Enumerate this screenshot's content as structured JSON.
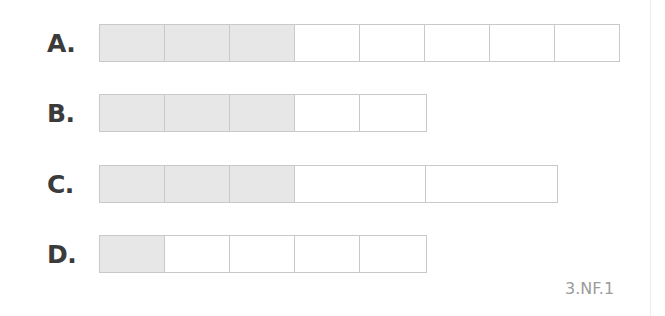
{
  "diagram": {
    "type": "fraction-bar-models",
    "shaded_color": "#e7e7e7",
    "border_color": "#c9c9c9",
    "label_color": "#3b3b3b",
    "rows": [
      {
        "label": "A.",
        "total_parts": 8,
        "shaded_parts": 3,
        "fraction": "3/8",
        "cell_widths": [
          65,
          65,
          65,
          65,
          65,
          65,
          65,
          64
        ]
      },
      {
        "label": "B.",
        "total_parts": 5,
        "shaded_parts": 3,
        "fraction": "3/5",
        "cell_widths": [
          65,
          65,
          65,
          65,
          66
        ]
      },
      {
        "label": "C.",
        "total_parts": 5,
        "shaded_parts": 3,
        "fraction": "3/5",
        "cell_widths": [
          65,
          65,
          65,
          131,
          131
        ]
      },
      {
        "label": "D.",
        "total_parts": 5,
        "shaded_parts": 1,
        "fraction": "1/5",
        "cell_widths": [
          65,
          65,
          65,
          65,
          66
        ]
      }
    ],
    "standard_code": "3.NF.1"
  }
}
